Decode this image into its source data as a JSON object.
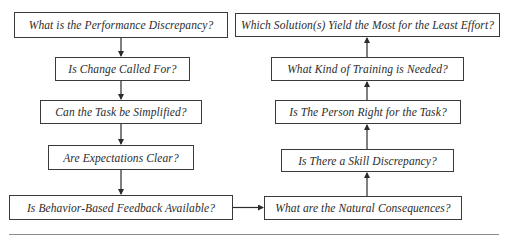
{
  "diagram": {
    "type": "flowchart",
    "left_column": [
      {
        "id": "L1",
        "label": "What is the Performance Discrepancy?"
      },
      {
        "id": "L2",
        "label": "Is Change Called For?"
      },
      {
        "id": "L3",
        "label": "Can the Task be Simplified?"
      },
      {
        "id": "L4",
        "label": "Are Expectations Clear?"
      },
      {
        "id": "L5",
        "label": "Is Behavior-Based Feedback Available?"
      }
    ],
    "right_column": [
      {
        "id": "R1",
        "label": "Which Solution(s) Yield the Most for the Least Effort?"
      },
      {
        "id": "R2",
        "label": "What Kind of Training is Needed?"
      },
      {
        "id": "R3",
        "label": "Is The Person Right for the Task?"
      },
      {
        "id": "R4",
        "label": "Is There a Skill Discrepancy?"
      },
      {
        "id": "R5",
        "label": "What are the Natural Consequences?"
      }
    ],
    "edges": [
      {
        "from": "L1",
        "to": "L2"
      },
      {
        "from": "L2",
        "to": "L3"
      },
      {
        "from": "L3",
        "to": "L4"
      },
      {
        "from": "L4",
        "to": "L5"
      },
      {
        "from": "L5",
        "to": "R5"
      },
      {
        "from": "R5",
        "to": "R4"
      },
      {
        "from": "R4",
        "to": "R3"
      },
      {
        "from": "R3",
        "to": "R2"
      },
      {
        "from": "R2",
        "to": "R1"
      }
    ],
    "colors": {
      "border": "#3a3a3a",
      "text": "#2b2b2b",
      "divider": "#8a8a8a",
      "background": "#ffffff"
    }
  }
}
